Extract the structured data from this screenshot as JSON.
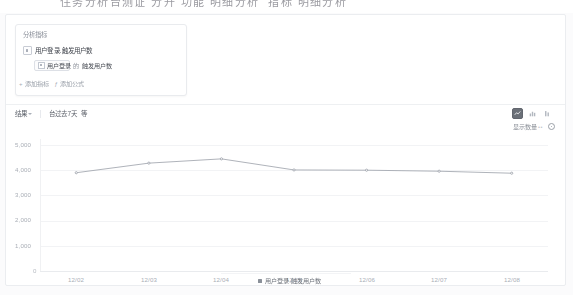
{
  "top_heading": "住务分析台测证 分升 功能 明细分析  指标 明细分析",
  "metric_card": {
    "title": "分析指标",
    "metric_label": "用户登录.触发用户数",
    "sub": {
      "event_tag": "用户登录",
      "connector": "的",
      "measure": "触发用户数"
    },
    "actions": [
      {
        "icon": "plus-icon",
        "glyph": "+",
        "label": "添加指标"
      },
      {
        "icon": "formula-icon",
        "glyph": "ƒ",
        "label": "添加公式"
      }
    ]
  },
  "toolbar": {
    "items": [
      {
        "label": "结果",
        "has_caret": true
      },
      {
        "label": "台过去7天",
        "has_caret": false
      },
      {
        "label": "等",
        "has_caret": false
      }
    ]
  },
  "chart_types": [
    {
      "name": "line-chart-icon",
      "active": true
    },
    {
      "name": "bar-chart-icon",
      "active": false
    },
    {
      "name": "stacked-chart-icon",
      "active": false
    }
  ],
  "show_count": {
    "label": "显示数量",
    "dots": "••",
    "gear": "gear-icon"
  },
  "chart_data": {
    "type": "line",
    "title": "",
    "xlabel": "",
    "ylabel": "",
    "categories": [
      "12/02",
      "12/03",
      "12/04",
      "12/05",
      "12/06",
      "12/07",
      "12/08"
    ],
    "series": [
      {
        "name": "用户登录.触发用户数",
        "color": "#9aa0a8",
        "values": [
          3900,
          4280,
          4450,
          4010,
          4000,
          3960,
          3880
        ]
      }
    ],
    "ylim": [
      0,
      5000
    ],
    "yticks": [
      1000,
      2000,
      3000,
      4000,
      5000
    ],
    "ytick_labels": [
      "1,000",
      "2,000",
      "3,000",
      "4,000",
      "5,000"
    ],
    "zero_label": "0",
    "grid": true,
    "legend": [
      "用户登录.触发用户数"
    ],
    "legend_position": "bottom"
  }
}
